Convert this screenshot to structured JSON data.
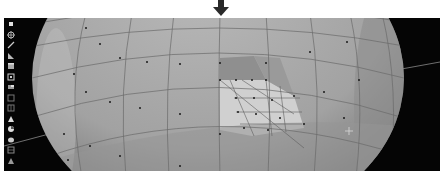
{
  "indicator": {
    "icon": "down-arrow-icon",
    "color": "#2a2a2a"
  },
  "viewport": {
    "background": "#050505",
    "mesh_color": "#a9a9a9",
    "selected_face_color": "#cfcfcf",
    "edge_color": "#6a6a6a",
    "vertex_color": "#1a1a1a",
    "horizon_color": "#8a8a8a"
  },
  "toolbar": {
    "tools": [
      {
        "icon": "select-box-icon"
      },
      {
        "icon": "cursor-icon"
      },
      {
        "icon": "move-icon"
      },
      {
        "icon": "rotate-icon"
      },
      {
        "icon": "scale-icon"
      },
      {
        "icon": "transform-icon"
      },
      {
        "icon": "annotate-icon"
      },
      {
        "icon": "measure-icon"
      },
      {
        "icon": "add-cube-icon"
      },
      {
        "icon": "extrude-icon"
      },
      {
        "icon": "inset-icon"
      },
      {
        "icon": "bevel-icon"
      },
      {
        "icon": "loop-cut-icon"
      },
      {
        "icon": "knife-icon"
      },
      {
        "icon": "poly-build-icon"
      }
    ]
  },
  "cursor": {
    "icon": "crosshair-icon"
  }
}
